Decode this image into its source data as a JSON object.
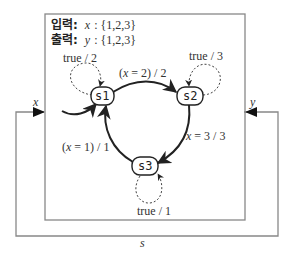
{
  "header": {
    "input_label": "입력:",
    "input_var": "x",
    "input_set": ": {1,2,3}",
    "output_label": "출력:",
    "output_var": "y",
    "output_set": ": {1,2,3}"
  },
  "states": [
    {
      "id": "s1",
      "label": "s1",
      "initial": true
    },
    {
      "id": "s2",
      "label": "s2"
    },
    {
      "id": "s3",
      "label": "s3"
    }
  ],
  "transitions": [
    {
      "from": "s1",
      "to": "s1",
      "label": "true / 2",
      "style": "dashed"
    },
    {
      "from": "s1",
      "to": "s2",
      "label": "(x = 2) / 2",
      "style": "solid"
    },
    {
      "from": "s2",
      "to": "s2",
      "label": "true / 3",
      "style": "dashed"
    },
    {
      "from": "s2",
      "to": "s3",
      "label": "x = 3 / 3",
      "style": "solid"
    },
    {
      "from": "s3",
      "to": "s3",
      "label": "true / 1",
      "style": "dashed"
    },
    {
      "from": "s3",
      "to": "s1",
      "label": "(x = 1) / 1",
      "style": "solid"
    }
  ],
  "ports": {
    "input": "x",
    "output": "y",
    "feedback": "s"
  },
  "colors": {
    "frame": "#888888",
    "edge": "#222222",
    "text": "#333333"
  }
}
